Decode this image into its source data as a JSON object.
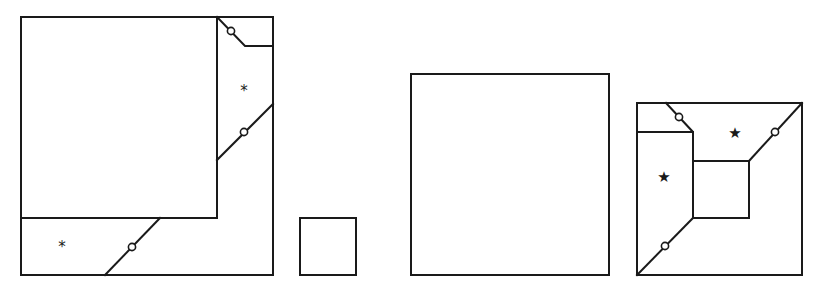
{
  "diagram": {
    "figures": [
      {
        "id": "fig-1",
        "description": "Large square with a square removed corner arrangement and cut lines",
        "marks": [
          {
            "symbol": "*",
            "x": 244,
            "y": 91
          },
          {
            "symbol": "*",
            "x": 62,
            "y": 247
          }
        ]
      },
      {
        "id": "fig-2",
        "description": "Small square"
      },
      {
        "id": "fig-3",
        "description": "Medium square"
      },
      {
        "id": "fig-4",
        "description": "Square with inner square and diagonal cut lines",
        "marks": [
          {
            "symbol": "★",
            "x": 735,
            "y": 133
          },
          {
            "symbol": "★",
            "x": 664,
            "y": 177
          }
        ]
      }
    ],
    "colors": {
      "stroke": "#1a1a1a",
      "background": "#ffffff"
    }
  }
}
